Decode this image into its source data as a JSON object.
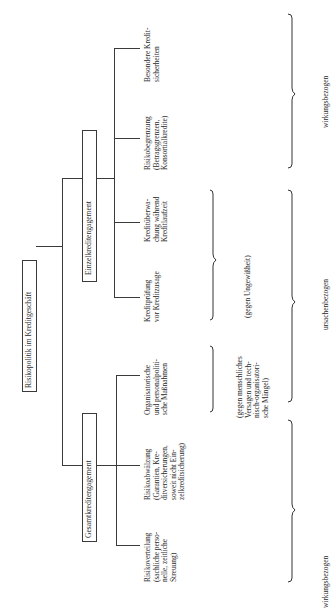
{
  "diagram": {
    "orientation": "rotated 90 degrees counter-clockwise",
    "root": {
      "label": "Risikopolitik im Kreditgeschäft"
    },
    "branches": [
      {
        "label": "Einzelkreditengagement",
        "leaves": [
          {
            "label": "Kreditprüfung\nvor Kreditzusage"
          },
          {
            "label": "Kreditüberwa-\nchung während\nKreditlaufzeit"
          },
          {
            "label": "Risikobegrenzung\n(Betragsgrenzen,\nKonsortialkredite)"
          },
          {
            "label": "Besondere Kredit-\nsicherheiten"
          }
        ]
      },
      {
        "label": "Gesamtkreditengagement",
        "leaves": [
          {
            "label": "Risikoverteilung\n(sachliche perso-\nnelle, zeitliche\nStreuung)"
          },
          {
            "label": "Risikoabwälzung\n(Garantien, Kre-\nditversicherungen,\nsoweit nicht Ein-\nzelkreditsicherung)"
          },
          {
            "label": "Organisatorische\nund personalpoliti-\nsche Maßnahmen"
          }
        ]
      }
    ],
    "annotations": {
      "gegen_menschliches": "(gegen menschliches\nVersagen und tech-\nnisch-organisatori-\nsche Mängel)",
      "gegen_ungewissheit": "(gegen Ungewißheit)",
      "wirkungsbezogen_top": "wirkungsbezogen",
      "ursachenbezogen": "ursachenbezogen",
      "wirkungsbezogen_bottom": "wirkungsbezogen"
    }
  }
}
